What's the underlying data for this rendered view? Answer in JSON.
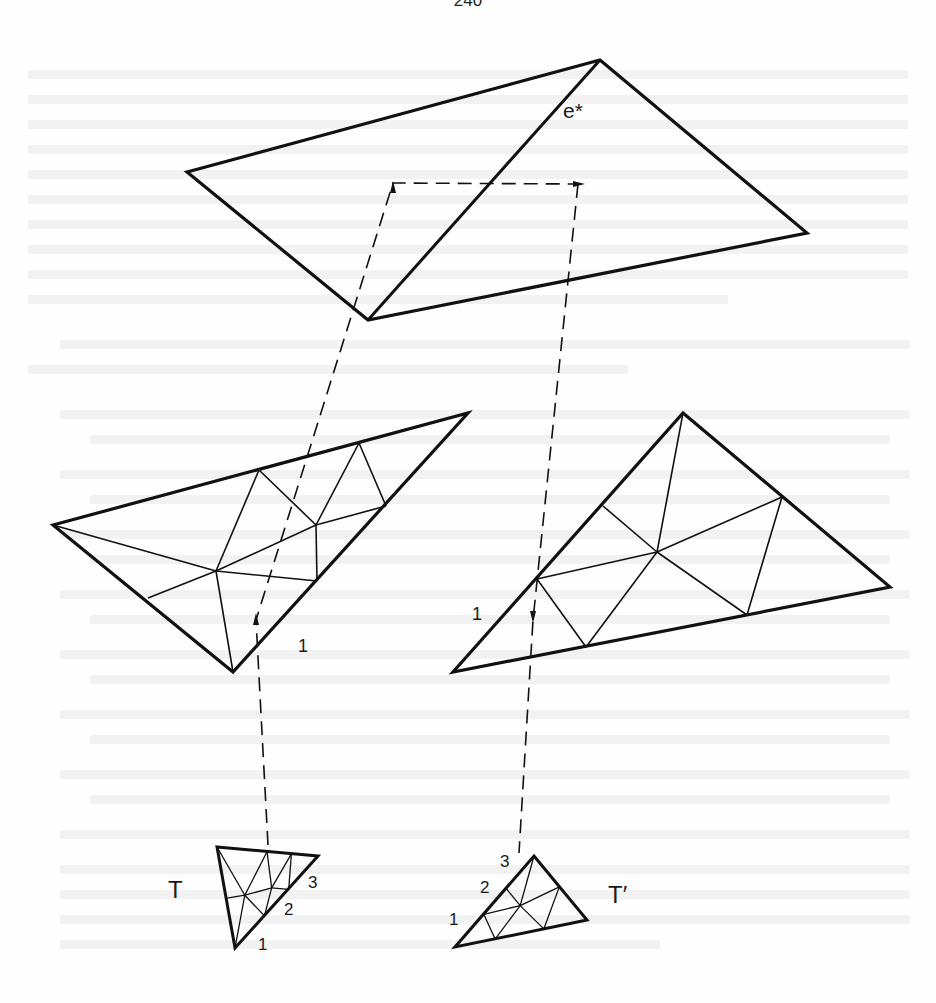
{
  "page": {
    "page_number": "240",
    "ink_color": "#111111"
  },
  "figure": {
    "top_quad": {
      "label": "e*",
      "label_pos": [
        563,
        118
      ],
      "outline": [
        [
          187,
          172
        ],
        [
          600,
          60
        ],
        [
          807,
          233
        ],
        [
          368,
          320
        ]
      ],
      "diagonal": [
        [
          600,
          60
        ],
        [
          368,
          320
        ]
      ]
    },
    "left_triangle": {
      "vertices": {
        "L": [
          53,
          525
        ],
        "TR": [
          468,
          413
        ],
        "B": [
          233,
          672
        ]
      },
      "points": {
        "A": [
          259,
          470
        ],
        "Bp": [
          359,
          443
        ],
        "C": [
          216,
          571
        ],
        "D": [
          316,
          525
        ],
        "E": [
          386,
          506
        ],
        "F": [
          317,
          581
        ],
        "G": [
          148,
          598
        ]
      },
      "edges": [
        [
          "L",
          "C"
        ],
        [
          "C",
          "A"
        ],
        [
          "A",
          "D"
        ],
        [
          "D",
          "Bp"
        ],
        [
          "Bp",
          "E"
        ],
        [
          "C",
          "D"
        ],
        [
          "D",
          "E"
        ],
        [
          "C",
          "F"
        ],
        [
          "D",
          "F"
        ],
        [
          "C",
          "G"
        ],
        [
          "C",
          "B"
        ]
      ],
      "edge_label": {
        "text": "1",
        "pos": [
          298,
          652
        ]
      }
    },
    "right_triangle": {
      "vertices": {
        "T": [
          683,
          413
        ],
        "R": [
          890,
          587
        ],
        "BL": [
          453,
          672
        ]
      },
      "points": {
        "P1": [
          603,
          506
        ],
        "P2": [
          537,
          579
        ],
        "Q": [
          657,
          552
        ],
        "Rr": [
          782,
          497
        ],
        "S": [
          586,
          647
        ],
        "U": [
          747,
          615
        ]
      },
      "edges": [
        [
          "T",
          "Q"
        ],
        [
          "P1",
          "Q"
        ],
        [
          "Q",
          "Rr"
        ],
        [
          "P2",
          "Q"
        ],
        [
          "Q",
          "S"
        ],
        [
          "Q",
          "U"
        ],
        [
          "Rr",
          "U"
        ],
        [
          "P2",
          "S"
        ]
      ],
      "edge_label": {
        "text": "1",
        "pos": [
          472,
          620
        ]
      }
    },
    "small_T": {
      "label": "T",
      "label_pos": [
        168,
        898
      ],
      "vertices": [
        [
          217,
          847
        ],
        [
          318,
          856
        ],
        [
          235,
          948
        ]
      ],
      "vertex_labels": [
        {
          "text": "1",
          "pos": [
            258,
            950
          ]
        },
        {
          "text": "2",
          "pos": [
            284,
            915
          ]
        },
        {
          "text": "3",
          "pos": [
            308,
            888
          ]
        }
      ]
    },
    "small_T_prime": {
      "label": "T′",
      "label_pos": [
        608,
        903
      ],
      "vertices": [
        [
          534,
          856
        ],
        [
          587,
          920
        ],
        [
          455,
          947
        ]
      ],
      "vertex_labels": [
        {
          "text": "1",
          "pos": [
            449,
            925
          ]
        },
        {
          "text": "2",
          "pos": [
            480,
            893
          ]
        },
        {
          "text": "3",
          "pos": [
            500,
            867
          ]
        }
      ]
    },
    "dashed_paths": [
      {
        "name": "left-correspondence-path",
        "points": [
          [
            268,
            845
          ],
          [
            256,
            620
          ],
          [
            393,
            183
          ],
          [
            578,
            184
          ]
        ],
        "arrows": [
          {
            "at": [
              256,
              622
            ],
            "dir": "up"
          },
          {
            "at": [
              393,
              190
            ],
            "dir": "up"
          },
          {
            "at": [
              576,
              184
            ],
            "dir": "right"
          }
        ]
      },
      {
        "name": "right-correspondence-path",
        "points": [
          [
            578,
            184
          ],
          [
            533,
            620
          ],
          [
            519,
            853
          ]
        ],
        "arrows": [
          {
            "at": [
              533,
              614
            ],
            "dir": "down"
          }
        ]
      }
    ]
  }
}
